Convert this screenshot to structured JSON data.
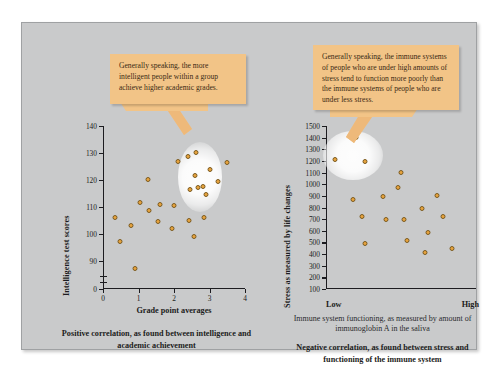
{
  "figure": {
    "background_color": "#c9cacb",
    "accent_color": "#f2c487",
    "dot_color": "#e8a33d",
    "dot_border_color": "#7a5a20"
  },
  "callouts": [
    {
      "id": "left",
      "text": "Generally speaking, the more intelligent people within a group achieve higher academic grades."
    },
    {
      "id": "right",
      "text": "Generally speaking, the immune systems of people who are under high amounts of stress tend to function more poorly than the immune systems of people who are under less stress."
    }
  ],
  "captions": {
    "left": "Positive correlation, as found between intelligence and academic achievement",
    "right": "Negative correlation, as found between stress and functioning of the immune system"
  },
  "chart_data": [
    {
      "id": "left",
      "type": "scatter",
      "title": "",
      "xlabel": "Grade point averages",
      "ylabel": "Intelligence test scores",
      "xlim": [
        0,
        4
      ],
      "ylim": [
        85,
        140
      ],
      "xticks": [
        "0",
        "1",
        "2",
        "3",
        "4"
      ],
      "yticks": [
        "140",
        "130",
        "120",
        "110",
        "100",
        "90",
        "0"
      ],
      "y_axis_break": true,
      "grid": false,
      "legend": "none",
      "points": [
        {
          "x": 0.35,
          "y": 106
        },
        {
          "x": 0.48,
          "y": 97
        },
        {
          "x": 0.78,
          "y": 103
        },
        {
          "x": 0.9,
          "y": 87
        },
        {
          "x": 1.05,
          "y": 111.5
        },
        {
          "x": 1.28,
          "y": 120
        },
        {
          "x": 1.3,
          "y": 108.5
        },
        {
          "x": 1.55,
          "y": 104.5
        },
        {
          "x": 1.6,
          "y": 111
        },
        {
          "x": 1.95,
          "y": 102
        },
        {
          "x": 2.0,
          "y": 110.5
        },
        {
          "x": 2.1,
          "y": 127
        },
        {
          "x": 2.4,
          "y": 128.5
        },
        {
          "x": 2.42,
          "y": 105
        },
        {
          "x": 2.45,
          "y": 116.5
        },
        {
          "x": 2.55,
          "y": 99
        },
        {
          "x": 2.6,
          "y": 121.5
        },
        {
          "x": 2.62,
          "y": 130
        },
        {
          "x": 2.68,
          "y": 117
        },
        {
          "x": 2.82,
          "y": 117.5
        },
        {
          "x": 2.85,
          "y": 106
        },
        {
          "x": 2.9,
          "y": 114.5
        },
        {
          "x": 3.0,
          "y": 124
        },
        {
          "x": 3.25,
          "y": 119.5
        },
        {
          "x": 3.48,
          "y": 126.5
        }
      ],
      "highlight": {
        "cx": 2.72,
        "cy": 121,
        "r_x": 0.62,
        "r_y": 13
      }
    },
    {
      "id": "right",
      "type": "scatter",
      "title": "",
      "xlabel": "Immune system functioning, as measured by amount of immunoglobin A in the saliva",
      "ylabel": "Stress as measured by life changes",
      "x_axis_low_label": "Low",
      "x_axis_high_label": "High",
      "xlim": [
        0,
        100
      ],
      "ylim": [
        100,
        1500
      ],
      "xticks": [],
      "yticks": [
        "1500",
        "1400",
        "1300",
        "1200",
        "1100",
        "1000",
        "900",
        "800",
        "700",
        "600",
        "500",
        "400",
        "300",
        "200",
        "100"
      ],
      "grid": false,
      "legend": "none",
      "points": [
        {
          "x": 6,
          "y": 1215
        },
        {
          "x": 20,
          "y": 1400
        },
        {
          "x": 26,
          "y": 1195
        },
        {
          "x": 18,
          "y": 870
        },
        {
          "x": 24,
          "y": 725
        },
        {
          "x": 26,
          "y": 495
        },
        {
          "x": 38,
          "y": 895
        },
        {
          "x": 40,
          "y": 700
        },
        {
          "x": 48,
          "y": 970
        },
        {
          "x": 50,
          "y": 1100
        },
        {
          "x": 52,
          "y": 695
        },
        {
          "x": 54,
          "y": 515
        },
        {
          "x": 64,
          "y": 790
        },
        {
          "x": 68,
          "y": 585
        },
        {
          "x": 66,
          "y": 415
        },
        {
          "x": 74,
          "y": 905
        },
        {
          "x": 78,
          "y": 725
        },
        {
          "x": 84,
          "y": 445
        }
      ],
      "highlight": {
        "cx": 18,
        "cy": 1250,
        "r_x": 20,
        "r_y": 210
      }
    }
  ]
}
